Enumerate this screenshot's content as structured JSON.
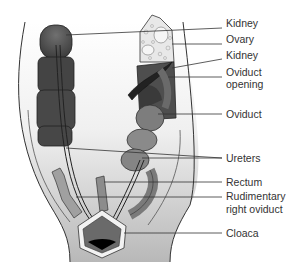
{
  "figure": {
    "labels": [
      {
        "text": "Kidney",
        "x": 226,
        "y": 23
      },
      {
        "text": "Ovary",
        "x": 226,
        "y": 38
      },
      {
        "text": "Kidney",
        "x": 226,
        "y": 54
      },
      {
        "text": "Oviduct",
        "x": 226,
        "y": 71
      },
      {
        "text": "opening",
        "x": 226,
        "y": 83
      },
      {
        "text": "Oviduct",
        "x": 226,
        "y": 109
      },
      {
        "text": "Ureters",
        "x": 226,
        "y": 153
      },
      {
        "text": "Rectum",
        "x": 226,
        "y": 176
      },
      {
        "text": "Rudimentary",
        "x": 226,
        "y": 191
      },
      {
        "text": "right oviduct",
        "x": 226,
        "y": 204
      },
      {
        "text": "Cloaca",
        "x": 226,
        "y": 227
      }
    ],
    "colors": {
      "dark_organ": "#4a4a4a",
      "mid_organ": "#7a7a7a",
      "light_body": "#d8d8d8",
      "ovary": "#e6e6e6",
      "line": "#333333"
    }
  }
}
